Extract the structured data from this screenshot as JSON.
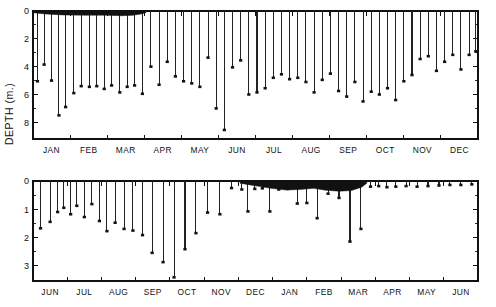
{
  "figure": {
    "y_axis_title": "DEPTH (m.)",
    "background_color": "#ffffff",
    "ink_color": "#111111"
  },
  "chart_data": [
    {
      "id": "top-panel",
      "type": "bar",
      "orientation": "downward-stems",
      "title": "",
      "xlabel": "",
      "ylabel": "DEPTH (m.)",
      "ylim": [
        0,
        9.2
      ],
      "y_inverted": true,
      "grid": false,
      "legend": null,
      "y_ticks_major": [
        0,
        2,
        4,
        6,
        8
      ],
      "y_ticks_minor": [
        1,
        3,
        5,
        7
      ],
      "y_tick_labels": [
        "0",
        "2",
        "4",
        "6",
        "8"
      ],
      "categories": [
        "JAN",
        "FEB",
        "MAR",
        "APR",
        "MAY",
        "JUN",
        "JUL",
        "AUG",
        "SEP",
        "OCT",
        "NOV",
        "DEC"
      ],
      "xlim_fraction": [
        0,
        12
      ],
      "series": [
        {
          "name": "snow/water depth",
          "x": [
            0.12,
            0.3,
            0.5,
            0.7,
            0.88,
            1.1,
            1.3,
            1.52,
            1.72,
            1.92,
            2.12,
            2.34,
            2.54,
            2.74,
            2.95,
            3.18,
            3.4,
            3.62,
            3.84,
            4.06,
            4.28,
            4.5,
            4.72,
            4.94,
            5.16,
            5.38,
            5.6,
            5.82,
            6.04,
            6.26,
            6.48,
            6.7,
            6.92,
            7.14,
            7.36,
            7.58,
            7.8,
            8.02,
            8.24,
            8.46,
            8.68,
            8.9,
            9.12,
            9.34,
            9.56,
            9.78,
            10.0,
            10.22,
            10.44,
            10.66,
            10.88,
            11.1,
            11.32,
            11.54,
            11.76,
            11.94
          ],
          "values": [
            5.05,
            3.85,
            5.0,
            7.5,
            6.9,
            5.9,
            5.4,
            5.45,
            5.4,
            5.6,
            5.35,
            5.85,
            5.45,
            5.35,
            5.95,
            4.0,
            5.3,
            3.65,
            4.7,
            5.05,
            5.2,
            5.45,
            3.35,
            7.0,
            8.55,
            4.05,
            3.55,
            6.0,
            5.85,
            5.55,
            4.8,
            4.55,
            4.9,
            4.8,
            5.1,
            5.85,
            4.95,
            4.5,
            5.75,
            6.15,
            5.1,
            6.5,
            5.8,
            6.0,
            5.55,
            6.4,
            5.05,
            4.6,
            3.45,
            3.25,
            4.3,
            3.65,
            3.15,
            4.2,
            3.15,
            2.9
          ]
        }
      ],
      "ice_cover_band": {
        "label": "ice cover",
        "x_start": 0.0,
        "x_end": 3.05,
        "profile": [
          {
            "x": 0.0,
            "depth": 0.12
          },
          {
            "x": 0.35,
            "depth": 0.22
          },
          {
            "x": 0.8,
            "depth": 0.28
          },
          {
            "x": 1.4,
            "depth": 0.3
          },
          {
            "x": 1.95,
            "depth": 0.3
          },
          {
            "x": 2.4,
            "depth": 0.34
          },
          {
            "x": 2.7,
            "depth": 0.3
          },
          {
            "x": 2.95,
            "depth": 0.2
          },
          {
            "x": 3.05,
            "depth": 0.1
          }
        ]
      }
    },
    {
      "id": "bottom-panel",
      "type": "bar",
      "orientation": "downward-stems",
      "title": "",
      "xlabel": "",
      "ylabel": "",
      "ylim": [
        0,
        3.55
      ],
      "y_inverted": true,
      "grid": false,
      "legend": null,
      "y_ticks_major": [
        0,
        1,
        2,
        3
      ],
      "y_ticks_minor": [
        0.5,
        1.5,
        2.5
      ],
      "y_tick_labels": [
        "0",
        "1",
        "2",
        "3"
      ],
      "categories": [
        "JUN",
        "JUL",
        "AUG",
        "SEP",
        "OCT",
        "NOV",
        "DEC",
        "JAN",
        "FEB",
        "MAR",
        "APR",
        "MAY",
        "JUN"
      ],
      "xlim_fraction": [
        0,
        13
      ],
      "series": [
        {
          "name": "snow/water depth",
          "x": [
            0.22,
            0.5,
            0.72,
            0.9,
            1.1,
            1.28,
            1.5,
            1.72,
            1.94,
            2.16,
            2.4,
            2.66,
            2.92,
            3.2,
            3.48,
            3.8,
            4.12,
            4.44,
            4.76,
            5.1,
            5.46,
            5.8,
            6.1,
            6.28,
            6.48,
            6.7,
            6.92,
            7.18,
            7.44,
            7.72,
            8.0,
            8.3,
            8.62,
            8.94,
            9.26,
            9.58,
            9.86,
            10.1,
            10.34,
            10.6,
            10.9,
            11.22,
            11.54,
            11.86,
            12.18,
            12.5,
            12.82
          ],
          "values": [
            1.68,
            1.45,
            1.1,
            0.95,
            1.18,
            0.88,
            1.28,
            0.82,
            1.42,
            1.78,
            1.48,
            1.7,
            1.76,
            1.92,
            2.55,
            2.88,
            3.42,
            2.42,
            1.85,
            1.12,
            1.18,
            0.25,
            0.3,
            1.08,
            0.28,
            0.26,
            1.08,
            0.3,
            0.28,
            0.8,
            0.78,
            1.32,
            0.45,
            0.6,
            2.15,
            1.7,
            0.2,
            0.18,
            0.22,
            0.2,
            0.18,
            0.2,
            0.18,
            0.16,
            0.14,
            0.14,
            0.12
          ]
        }
      ],
      "ice_cover_band": {
        "label": "ice cover",
        "x_start": 6.05,
        "x_end": 9.75,
        "profile": [
          {
            "x": 6.05,
            "depth": 0.08
          },
          {
            "x": 6.3,
            "depth": 0.13
          },
          {
            "x": 6.55,
            "depth": 0.18
          },
          {
            "x": 6.95,
            "depth": 0.26
          },
          {
            "x": 7.4,
            "depth": 0.32
          },
          {
            "x": 7.8,
            "depth": 0.3
          },
          {
            "x": 8.2,
            "depth": 0.26
          },
          {
            "x": 8.55,
            "depth": 0.33
          },
          {
            "x": 8.95,
            "depth": 0.36
          },
          {
            "x": 9.3,
            "depth": 0.34
          },
          {
            "x": 9.6,
            "depth": 0.22
          },
          {
            "x": 9.75,
            "depth": 0.08
          }
        ]
      }
    }
  ]
}
